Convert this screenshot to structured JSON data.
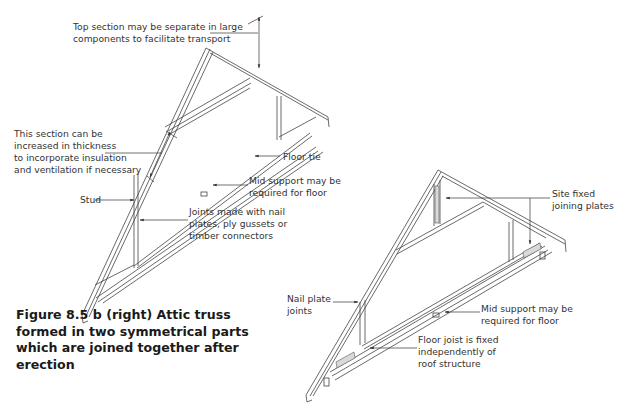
{
  "figure": {
    "caption": "Figure 8.5 b (right) Attic truss formed in two symmetrical parts which are joined together after erection"
  },
  "left_truss": {
    "annotations": {
      "top_section": "Top section may be separate in large\ncomponents to facilitate transport",
      "section_thickness": "This section can be\nincreased in thickness\nto incorporate insulation\nand ventilation if necessary",
      "floor_tie": "Floor tie",
      "mid_support": "Mid support may be\nrequired for floor",
      "stud": "Stud",
      "joints": "Joints made with nail\nplates, ply gussets or\ntimber connectors"
    }
  },
  "right_truss": {
    "annotations": {
      "site_fixed": "Site fixed\njoining plates",
      "nail_plate": "Nail plate\njoints",
      "mid_support": "Mid support may be\nrequired for floor",
      "floor_joist": "Floor joist is fixed\nindependently of\nroof structure"
    }
  },
  "colors": {
    "line": "#444444",
    "plate_fill": "#d9d9d9",
    "text": "#333333"
  }
}
